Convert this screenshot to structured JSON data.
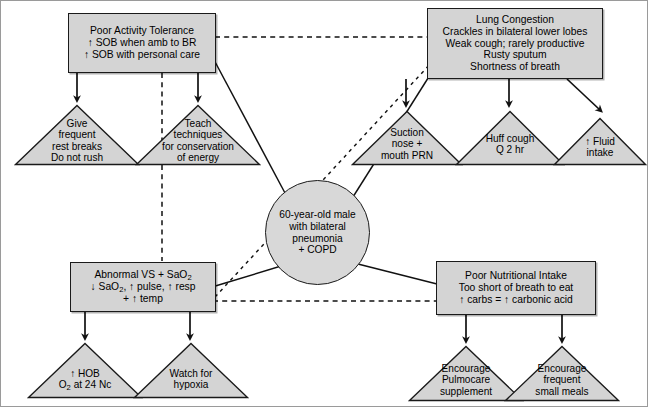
{
  "diagram": {
    "center": {
      "name": "center-node",
      "lines": [
        "60-year-old male",
        "with bilateral",
        "pneumonia",
        "+ COPD"
      ]
    },
    "problems": [
      {
        "id": "poor-activity-tolerance",
        "lines": [
          "Poor Activity Tolerance",
          "↑ SOB when amb to BR",
          "↑ SOB with personal care"
        ]
      },
      {
        "id": "lung-congestion",
        "lines": [
          "Lung Congestion",
          "Crackles in bilateral lower lobes",
          "Weak cough; rarely productive",
          "Rusty sputum",
          "Shortness of breath"
        ]
      },
      {
        "id": "abnormal-vs-sao2",
        "lines": [
          "Abnormal VS + SaO2",
          "↓ SaO2, ↑ pulse, ↑ resp",
          "+ ↑ temp"
        ],
        "rich": [
          "Abnormal VS + SaO<sub>2</sub>",
          "↓ SaO<sub>2</sub>, ↑ pulse, ↑ resp",
          "+ ↑ temp"
        ]
      },
      {
        "id": "poor-nutritional-intake",
        "lines": [
          "Poor Nutritional Intake",
          "Too short of breath to eat",
          "↑ carbs = ↑ carbonic acid"
        ]
      }
    ],
    "interventions": [
      {
        "id": "give-frequent-rest-breaks",
        "lines": [
          "Give",
          "frequent",
          "rest breaks",
          "Do not rush"
        ]
      },
      {
        "id": "teach-conservation-of-energy",
        "lines": [
          "Teach",
          "techniques",
          "for conservation",
          "of energy"
        ]
      },
      {
        "id": "suction-nose-mouth-prn",
        "lines": [
          "Suction",
          "nose +",
          "mouth PRN"
        ]
      },
      {
        "id": "huff-cough-q2hr",
        "lines": [
          "Huff cough",
          "Q 2 hr"
        ]
      },
      {
        "id": "increase-fluid-intake",
        "lines": [
          "↑ Fluid",
          "intake"
        ]
      },
      {
        "id": "increase-hob-oxygen",
        "lines": [
          "↑ HOB",
          "O2 at 24 Nc"
        ],
        "rich": [
          "↑ HOB",
          "O<sub>2</sub> at 24 Nc"
        ]
      },
      {
        "id": "watch-for-hypoxia",
        "lines": [
          "Watch for",
          "hypoxia"
        ]
      },
      {
        "id": "encourage-pulmocare-supplement",
        "lines": [
          "Encourage",
          "Pulmocare",
          "supplement"
        ]
      },
      {
        "id": "encourage-frequent-small-meals",
        "lines": [
          "Encourage",
          "frequent",
          "small meals"
        ]
      }
    ],
    "colors": {
      "node_fill": "#d4d4d4",
      "circle_fill": "#d8d8d8",
      "stroke": "#1a1a1a",
      "frame": "#9a9a9a",
      "background": "#ffffff"
    }
  }
}
